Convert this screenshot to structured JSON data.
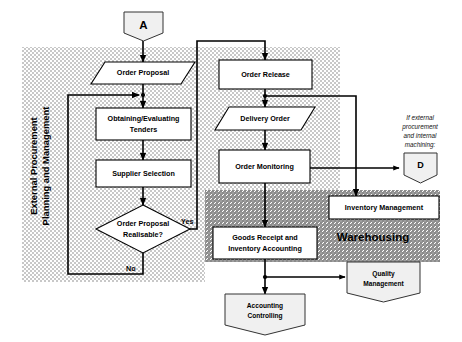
{
  "diagram": {
    "regions": [
      {
        "id": "ext-proc",
        "label_line1": "External Procurement",
        "label_line2": "Planning and Management",
        "fill": "#d9d9d9"
      },
      {
        "id": "warehousing",
        "label": "Warehousing",
        "fill": "#bdbdbd"
      }
    ],
    "nodes": {
      "connector_a": {
        "label": "A",
        "shape": "pentagon"
      },
      "connector_d": {
        "label": "D",
        "shape": "pentagon"
      },
      "order_proposal_io": {
        "label": "Order Proposal",
        "shape": "parallelogram"
      },
      "obtaining_tenders": {
        "label_line1": "Obtaining/Evaluating",
        "label_line2": "Tenders",
        "shape": "rect"
      },
      "supplier_selection": {
        "label": "Supplier Selection",
        "shape": "rect"
      },
      "decision": {
        "label_line1": "Order Proposal",
        "label_line2": "Realisable?",
        "shape": "diamond"
      },
      "order_release": {
        "label": "Order Release",
        "shape": "rect"
      },
      "delivery_order": {
        "label": "Delivery Order",
        "shape": "parallelogram"
      },
      "order_monitoring": {
        "label": "Order Monitoring",
        "shape": "rect"
      },
      "inventory_management": {
        "label": "Inventory Management",
        "shape": "rect"
      },
      "goods_receipt": {
        "label_line1": "Goods Receipt and",
        "label_line2": "Inventory Accounting",
        "shape": "rect"
      },
      "quality_management": {
        "label_line1": "Quality",
        "label_line2": "Management",
        "shape": "pentagon"
      },
      "accounting_controlling": {
        "label_line1": "Accounting",
        "label_line2": "Controlling",
        "shape": "pentagon"
      }
    },
    "edge_labels": {
      "yes": "Yes",
      "no": "No"
    },
    "annotations": {
      "external_note_line1": "If external",
      "external_note_line2": "procurement",
      "external_note_line3": "and internal",
      "external_note_line4": "machining:"
    },
    "colors": {
      "background": "#ffffff",
      "region_light": "#d9d9d9",
      "region_dark": "#bdbdbd",
      "node_fill": "#ffffff",
      "doc_fill": "#f0f0f0",
      "line": "#000000"
    }
  }
}
